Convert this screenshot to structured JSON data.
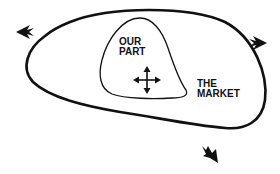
{
  "diagram": {
    "outer_region": {
      "label_line1": "THE",
      "label_line2": "MARKET"
    },
    "inner_region": {
      "label_line1": "OUR",
      "label_line2": "PART"
    },
    "icons": {
      "center": "move-icon",
      "arrows": [
        "arrow-left-icon",
        "arrow-right-icon",
        "arrow-down-right-icon"
      ]
    },
    "colors": {
      "stroke": "#111111",
      "background": "#ffffff"
    }
  }
}
